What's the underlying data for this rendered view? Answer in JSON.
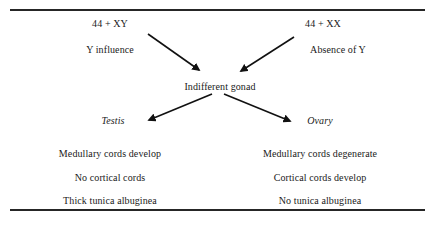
{
  "diagram": {
    "title_present": false,
    "top_rule": "horizontal-rule",
    "bottom_rule": "horizontal-rule",
    "nodes": {
      "male_karyotype": "44 + XY",
      "female_karyotype": "44 + XX",
      "male_factor": "Y influence",
      "female_factor": "Absence of Y",
      "center": "Indifferent gonad",
      "male_outcome": "Testis",
      "female_outcome": "Ovary"
    },
    "male_traits": [
      "Medullary cords develop",
      "No cortical cords",
      "Thick tunica albuginea"
    ],
    "female_traits": [
      "Medullary cords degenerate",
      "Cortical cords develop",
      "No tunica albuginea"
    ],
    "arrows": [
      {
        "name": "arrow-xy-to-gonad",
        "x1": 148,
        "y1": 34,
        "x2": 201,
        "y2": 71
      },
      {
        "name": "arrow-xx-to-gonad",
        "x1": 294,
        "y1": 37,
        "x2": 239,
        "y2": 72
      },
      {
        "name": "arrow-gonad-to-testis",
        "x1": 212,
        "y1": 94,
        "x2": 147,
        "y2": 121
      },
      {
        "name": "arrow-gonad-to-ovary",
        "x1": 224,
        "y1": 94,
        "x2": 292,
        "y2": 122
      }
    ],
    "colors": {
      "ink": "#1a1a1a",
      "rule": "#262626",
      "background": "#ffffff"
    }
  }
}
